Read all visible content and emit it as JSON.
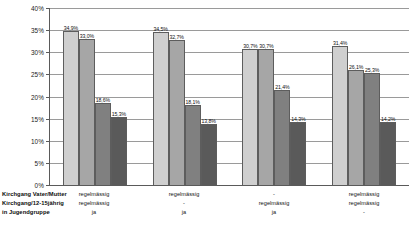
{
  "chart_data": {
    "type": "bar",
    "title": "",
    "xlabel": "",
    "ylabel": "",
    "ylim": [
      0,
      40
    ],
    "ytick_labels": [
      "40%",
      "35%",
      "30%",
      "25%",
      "20%",
      "15%",
      "10%",
      "5%",
      "0%"
    ],
    "ytick_values": [
      40,
      35,
      30,
      25,
      20,
      15,
      10,
      5,
      0
    ],
    "grid": true,
    "legend": "none",
    "value_label_suffix": "%",
    "decimal_separator": ",",
    "categories": [
      {
        "lines": [
          "regelmässig",
          "regelmässig",
          "ja"
        ]
      },
      {
        "lines": [
          "regelmässig",
          "-",
          "ja"
        ]
      },
      {
        "lines": [
          "-",
          "regelmässig",
          "ja"
        ]
      },
      {
        "lines": [
          "regelmässig",
          "regelmässig",
          "-"
        ]
      }
    ],
    "row_labels": [
      "Kirchgang Vater/Mutter",
      "Kirchgang/12-15jährig",
      "in Jugendgruppe"
    ],
    "series": [
      {
        "name": "series-1",
        "color": "#cfcfcf",
        "values": [
          34.9,
          34.5,
          30.7,
          31.4
        ],
        "labels": [
          "34,9%",
          "34,5%",
          "30,7%",
          "31,4%"
        ]
      },
      {
        "name": "series-2",
        "color": "#a6a6a6",
        "values": [
          33.0,
          32.7,
          30.7,
          26.1
        ],
        "labels": [
          "33,0%",
          "32,7%",
          "30,7%",
          "26,1%"
        ]
      },
      {
        "name": "series-3",
        "color": "#808080",
        "values": [
          18.6,
          18.1,
          21.4,
          25.3
        ],
        "labels": [
          "18,6%",
          "18,1%",
          "21,4%",
          "25,3%"
        ]
      },
      {
        "name": "series-4",
        "color": "#5a5a5a",
        "values": [
          15.3,
          13.8,
          14.3,
          14.2
        ],
        "labels": [
          "15,3%",
          "13,8%",
          "14,3%",
          "14,2%"
        ]
      }
    ]
  }
}
